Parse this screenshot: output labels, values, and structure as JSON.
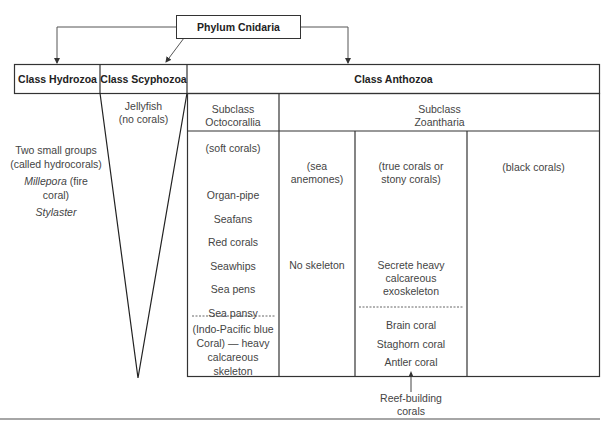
{
  "phylum": {
    "label": "Phylum Cnidaria"
  },
  "classes": {
    "hydrozoa": {
      "label": "Class Hydrozoa",
      "lines": [
        "Two small groups",
        "(called hydrocorals)"
      ],
      "genus1": "Millepora",
      "genus1_suffix": " (fire coral)",
      "genus2": "Stylaster"
    },
    "scyphozoa": {
      "label": "Class Scyphozoa",
      "line1": "Jellyfish",
      "line2": "(no corals)"
    },
    "anthozoa": {
      "label": "Class Anthozoa",
      "subclasses": {
        "octocorallia": {
          "line1": "Subclass",
          "line2": "Octocorallia",
          "group": "(soft corals)",
          "members": [
            "Organ-pipe",
            "Seafans",
            "Red corals",
            "Seawhips",
            "Sea pens",
            "Sea pansy"
          ],
          "note": [
            "(Indo-Pacific blue",
            "Coral) — heavy",
            "calcareous skeleton"
          ]
        },
        "zoantharia": {
          "line1": "Subclass",
          "line2": "Zoantharia",
          "groups": {
            "anemones": {
              "line1": "(sea",
              "line2": "anemones)",
              "skeleton": "No skeleton"
            },
            "stony": {
              "line1": "(true corals or",
              "line2": "stony corals)",
              "skeleton": [
                "Secrete heavy",
                "calcareous",
                "exoskeleton"
              ],
              "members": [
                "Brain coral",
                "Staghorn coral",
                "Antler coral"
              ]
            },
            "black": {
              "label": "(black corals)"
            }
          }
        }
      }
    }
  },
  "annotation": {
    "line1": "Reef-building",
    "line2": "corals"
  }
}
